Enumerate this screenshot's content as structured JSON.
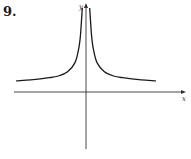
{
  "exercise_number": "9.",
  "chart_data": {
    "type": "line",
    "title": "",
    "xlabel": "x",
    "ylabel": "y",
    "xlim": [
      -4.3,
      5.9
    ],
    "ylim": [
      -3.5,
      5.5
    ],
    "grid": false,
    "legend": "none",
    "series": [
      {
        "name": "f(x) left branch",
        "x": [
          -3.8,
          -3.0,
          -2.0,
          -1.5,
          -1.0,
          -0.6,
          -0.4,
          -0.3,
          -0.2
        ],
        "y": [
          0.66,
          0.72,
          0.85,
          0.95,
          1.2,
          1.75,
          2.55,
          3.4,
          5.0
        ]
      },
      {
        "name": "f(x) right branch",
        "x": [
          0.2,
          0.3,
          0.4,
          0.6,
          1.0,
          1.5,
          2.0,
          3.0,
          3.8
        ],
        "y": [
          5.0,
          3.4,
          2.55,
          1.75,
          1.2,
          0.95,
          0.85,
          0.72,
          0.66
        ]
      }
    ],
    "colors": {
      "curve": "#1a1a1a",
      "axes": "#333333"
    }
  }
}
